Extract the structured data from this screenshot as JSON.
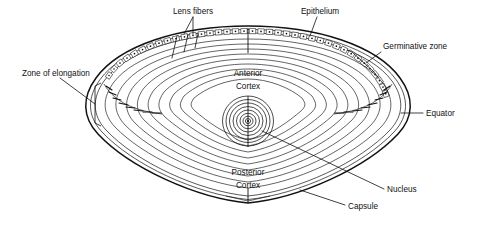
{
  "figure": {
    "background_color": "#ffffff",
    "line_color": "#111111",
    "width": 478,
    "height": 227
  },
  "labels": {
    "lens_fibers": "Lens fibers",
    "epithelium": "Epithelium",
    "germinative_zone": "Germinative zone",
    "zone_of_elongation": "Zone of elongation",
    "equator": "Equator",
    "nucleus": "Nucleus",
    "capsule": "Capsule",
    "anterior_cortex_line1": "Anterior",
    "anterior_cortex_line2": "Cortex",
    "posterior_cortex_line1": "Posterior",
    "posterior_cortex_line2": "Cortex"
  },
  "structure": {
    "epithelial_cell_count": 38,
    "cortex_fiber_layer_count": 9,
    "nucleus_ring_count": 8,
    "elongating_fiber_count_left": 8,
    "elongating_fiber_count_right": 8,
    "suture_positions": [
      "anterior-pole",
      "posterior-pole"
    ]
  }
}
